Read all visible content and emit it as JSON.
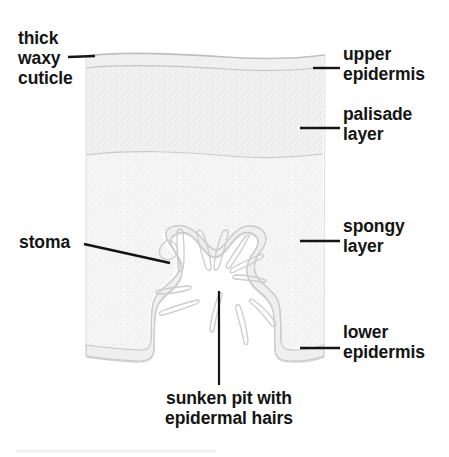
{
  "diagram": {
    "background_color": "#ffffff",
    "ink_color": "#141414",
    "tissue_fill_color": "#f4f4f4",
    "tissue_outline_color": "#c9c9c9",
    "labels": {
      "thick_waxy_cuticle": {
        "line1": "thick",
        "line2": "waxy",
        "line3": "cuticle"
      },
      "stoma": "stoma",
      "upper_epidermis": {
        "line1": "upper",
        "line2": "epidermis"
      },
      "palisade_layer": {
        "line1": "palisade",
        "line2": "layer"
      },
      "spongy_layer": {
        "line1": "spongy",
        "line2": "layer"
      },
      "lower_epidermis": {
        "line1": "lower",
        "line2": "epidermis"
      },
      "sunken_pit": {
        "line1": "sunken pit with",
        "line2": "epidermal hairs"
      }
    }
  }
}
